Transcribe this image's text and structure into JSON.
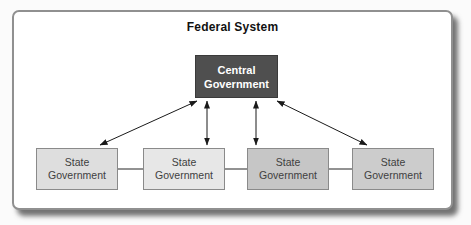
{
  "diagram": {
    "title": "Federal System",
    "central_box": {
      "label": "Central Government"
    },
    "state_boxes": [
      {
        "label": "State Government"
      },
      {
        "label": "State Government"
      },
      {
        "label": "State Government"
      },
      {
        "label": "State Government"
      }
    ],
    "colors": {
      "frame_border": "#909090",
      "title_text": "#111111",
      "central_fill": "#4f4f4f",
      "central_border": "#3a3a3a",
      "central_text": "#ffffff",
      "state_fills": [
        "#dedede",
        "#e7e7e7",
        "#c6c6c6",
        "#cccccc"
      ],
      "state_border": "#8a8a8a",
      "state_text": "#404040",
      "arrow": "#1a1a1a",
      "connector": "#4a4a4a"
    }
  }
}
